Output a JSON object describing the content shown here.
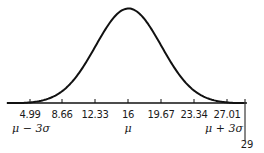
{
  "chart_data": {
    "type": "line",
    "title": "",
    "xlabel": "",
    "ylabel": "",
    "mean": 16,
    "std_dev": 3.67,
    "x_ticks": [
      4.99,
      8.66,
      12.33,
      16,
      19.67,
      23.34,
      27.01
    ],
    "tick_labels": [
      "4.99",
      "8.66",
      "12.33",
      "16",
      "19.67",
      "23.34",
      "27.01"
    ],
    "symbolic_labels": [
      {
        "at": 4.99,
        "text": "μ − 3σ"
      },
      {
        "at": 16,
        "text": "μ"
      },
      {
        "at": 27.01,
        "text": "μ + 3σ"
      }
    ],
    "marker": {
      "at": 29,
      "text": "29"
    },
    "xlim": [
      2.2,
      29.2
    ],
    "grid": false,
    "legend": false
  },
  "labels": {
    "t0": "4.99",
    "t1": "8.66",
    "t2": "12.33",
    "t3": "16",
    "t4": "19.67",
    "t5": "23.34",
    "t6": "27.01",
    "mu_minus": "μ − 3σ",
    "mu": "μ",
    "mu_plus": "μ + 3σ",
    "marker": "29"
  },
  "colors": {
    "curve": "#111111",
    "axis": "#111111",
    "background": "#ffffff"
  }
}
